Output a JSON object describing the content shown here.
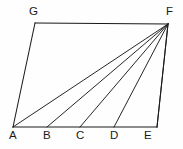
{
  "figure": {
    "background_color": "#fefefe",
    "line_color": "#1a1a1a",
    "label_color": "#1a1a1a",
    "canvas": {
      "width": 183,
      "height": 149
    },
    "points": {
      "A": {
        "label": "A",
        "x": 13,
        "y": 127,
        "label_x": 9,
        "label_y": 129
      },
      "B": {
        "label": "B",
        "x": 47,
        "y": 127,
        "label_x": 43,
        "label_y": 129
      },
      "C": {
        "label": "C",
        "x": 80,
        "y": 127,
        "label_x": 76,
        "label_y": 129
      },
      "D": {
        "label": "D",
        "x": 114,
        "y": 127,
        "label_x": 110,
        "label_y": 129
      },
      "E": {
        "label": "E",
        "x": 157,
        "y": 127,
        "label_x": 144,
        "label_y": 129
      },
      "F": {
        "label": "F",
        "x": 168,
        "y": 24,
        "label_x": 166,
        "label_y": 5
      },
      "G": {
        "label": "G",
        "x": 35,
        "y": 23,
        "label_x": 29,
        "label_y": 5
      }
    },
    "outline_path": "M 35 23 L 168 24 L 157 127 L 13 127 Z",
    "segments": [
      {
        "name": "segment-G-F",
        "from": "G",
        "to": "F",
        "d": "M 35 23 L 168 24",
        "kind": "edge"
      },
      {
        "name": "segment-F-E",
        "from": "F",
        "to": "E",
        "d": "M 168 24 L 157 127",
        "kind": "edge"
      },
      {
        "name": "segment-A-E",
        "from": "A",
        "to": "E",
        "d": "M 13 127 L 157 127",
        "kind": "edge"
      },
      {
        "name": "segment-A-G",
        "from": "A",
        "to": "G",
        "d": "M 13 127 L 35 23",
        "kind": "edge"
      },
      {
        "name": "cevian-F-A",
        "from": "F",
        "to": "A",
        "d": "M 168 24 L 13 127",
        "kind": "cevian"
      },
      {
        "name": "cevian-F-B",
        "from": "F",
        "to": "B",
        "d": "M 168 24 L 47 127",
        "kind": "cevian"
      },
      {
        "name": "cevian-F-C",
        "from": "F",
        "to": "C",
        "d": "M 168 24 L 80 127",
        "kind": "cevian"
      },
      {
        "name": "cevian-F-D",
        "from": "F",
        "to": "D",
        "d": "M 168 24 L 114 127",
        "kind": "cevian"
      },
      {
        "name": "cevian-F-E",
        "from": "F",
        "to": "E",
        "d": "M 168 24 L 157 127",
        "kind": "cevian"
      }
    ]
  }
}
